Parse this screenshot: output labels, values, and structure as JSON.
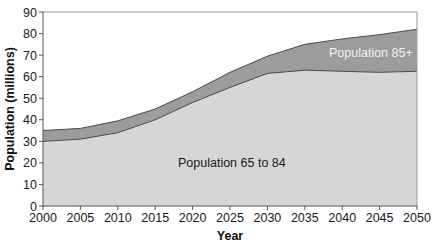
{
  "chart_data": {
    "type": "area",
    "stacked": true,
    "title": "",
    "xlabel": "Year",
    "ylabel": "Population (millions)",
    "x": [
      2000,
      2005,
      2010,
      2015,
      2020,
      2025,
      2030,
      2035,
      2040,
      2045,
      2050
    ],
    "xticks": [
      "2000",
      "2005",
      "2010",
      "2015",
      "2020",
      "2025",
      "2030",
      "2035",
      "2040",
      "2045",
      "2050"
    ],
    "yticks": [
      "0",
      "10",
      "20",
      "30",
      "40",
      "50",
      "60",
      "70",
      "80",
      "90"
    ],
    "ylim": [
      0,
      90
    ],
    "xlim": [
      2000,
      2050
    ],
    "grid": false,
    "legend": "none (inline area labels)",
    "series": [
      {
        "name": "Population 65 to 84",
        "values": [
          30,
          31,
          34,
          40,
          48,
          55,
          61.5,
          63,
          62.5,
          62,
          62.5
        ],
        "color": "#d6d6d6"
      },
      {
        "name": "Population 85+",
        "values": [
          5,
          5,
          5.5,
          5,
          5,
          7,
          8,
          12,
          15,
          17.5,
          19.5
        ],
        "color": "#9c9c9c"
      }
    ],
    "totals": [
      35,
      36,
      39.5,
      45,
      53,
      62,
      69.5,
      75,
      77.5,
      79.5,
      82
    ],
    "annotations": [
      {
        "text": "Population 65 to 84",
        "x": 2023,
        "y": 33
      },
      {
        "text": "Population 85+",
        "x": 2044,
        "y": 78
      }
    ]
  },
  "labels": {
    "ylabel": "Population (millions)",
    "xlabel": "Year",
    "series_lower": "Population 65 to 84",
    "series_upper": "Population 85+"
  },
  "colors": {
    "lower_fill": "#d6d6d6",
    "upper_fill": "#9c9c9c",
    "outline": "#4a4a4a",
    "axis": "#555555",
    "frame": "#9a9a9a",
    "upper_label_text": "#f2f2f2",
    "lower_label_text": "#1a1a1a"
  }
}
